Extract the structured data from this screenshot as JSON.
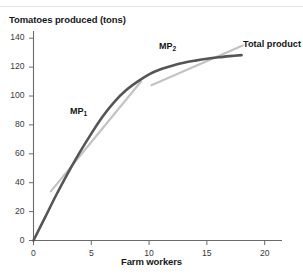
{
  "chart_data": {
    "type": "line",
    "title": "",
    "ylabel": "Tomatoes produced (tons)",
    "xlabel": "Farm workers",
    "xlim": [
      0,
      21.5
    ],
    "ylim": [
      0,
      145
    ],
    "xticks": [
      0,
      5,
      10,
      15,
      20
    ],
    "xtick_labels": [
      "0",
      "5",
      "10",
      "15",
      "20"
    ],
    "yticks": [
      0,
      20,
      40,
      60,
      80,
      100,
      120,
      140
    ],
    "ytick_labels": [
      "0",
      "20",
      "40",
      "60",
      "80",
      "100",
      "120",
      "140"
    ],
    "grid": false,
    "legend": "none",
    "series": [
      {
        "name": "Total product",
        "label": "Total product",
        "color": "#555558",
        "x": [
          0,
          1,
          2,
          3,
          4,
          5,
          6,
          7,
          8,
          9,
          10,
          11,
          12,
          13,
          14,
          15,
          16,
          17,
          18
        ],
        "values": [
          0,
          16,
          32,
          47,
          61,
          74,
          86,
          96,
          104,
          110,
          115,
          118.5,
          121,
          123,
          124.5,
          125.8,
          126.8,
          127.6,
          128.3
        ]
      },
      {
        "name": "MP1 tangent",
        "label": "MP",
        "sublabel": "1",
        "color": "#c3c3c5",
        "x": [
          1.5,
          9.3
        ],
        "values": [
          34,
          110
        ]
      },
      {
        "name": "MP2 tangent",
        "label": "MP",
        "sublabel": "2",
        "color": "#c3c3c5",
        "x": [
          10.2,
          18.1
        ],
        "values": [
          107.5,
          135
        ]
      }
    ],
    "annotations": [
      {
        "text": "MP",
        "sub": "1",
        "x": 5.2,
        "y": 88
      },
      {
        "text": "MP",
        "sub": "2",
        "x": 12.5,
        "y": 124
      },
      {
        "text": "Total product",
        "x": 19.0,
        "y": 129
      }
    ]
  }
}
